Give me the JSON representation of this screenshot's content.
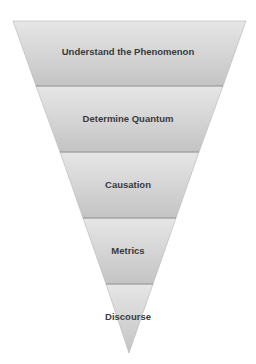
{
  "diagram": {
    "type": "inverted-funnel",
    "colors": {
      "band_top": "#e6e6e6",
      "band_bottom": "#c4c4c4",
      "separator": "#9a9a9a",
      "text": "#3a3a3a",
      "background": "#ffffff"
    },
    "stages": [
      {
        "label": "Understand the Phenomenon"
      },
      {
        "label": "Determine Quantum"
      },
      {
        "label": "Causation"
      },
      {
        "label": "Metrics"
      },
      {
        "label": "Discourse"
      }
    ]
  }
}
